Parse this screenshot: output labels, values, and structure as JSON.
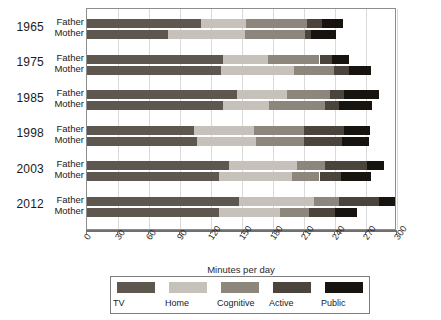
{
  "chart_data": {
    "type": "bar",
    "orientation": "horizontal",
    "stacked": true,
    "title": "",
    "xlabel": "Minutes per day",
    "ylabel": "",
    "xlim": [
      0,
      300
    ],
    "xticks": [
      0,
      30,
      60,
      90,
      120,
      150,
      180,
      210,
      240,
      270,
      300
    ],
    "grid": true,
    "legend_position": "bottom",
    "series": [
      {
        "name": "TV",
        "color": "#5e574f",
        "values": [
          110,
          78,
          132,
          130,
          145,
          132,
          104,
          106,
          137,
          128,
          147,
          128
        ]
      },
      {
        "name": "Home",
        "color": "#c6c2bb",
        "values": [
          44,
          75,
          43,
          70,
          49,
          44,
          58,
          58,
          66,
          70,
          73,
          59
        ]
      },
      {
        "name": "Cognitive",
        "color": "#8d867d",
        "values": [
          59,
          58,
          50,
          39,
          41,
          54,
          48,
          46,
          27,
          27,
          24,
          28
        ]
      },
      {
        "name": "Active",
        "color": "#4a443c",
        "values": [
          14,
          6,
          12,
          15,
          14,
          14,
          39,
          37,
          41,
          21,
          39,
          25
        ]
      },
      {
        "name": "Public",
        "color": "#17140f",
        "values": [
          21,
          24,
          17,
          21,
          34,
          32,
          25,
          26,
          16,
          29,
          15,
          21
        ]
      }
    ],
    "groups": [
      {
        "year": "1965",
        "rows": [
          "Father",
          "Mother"
        ]
      },
      {
        "year": "1975",
        "rows": [
          "Father",
          "Mother"
        ]
      },
      {
        "year": "1985",
        "rows": [
          "Father",
          "Mother"
        ]
      },
      {
        "year": "1998",
        "rows": [
          "Father",
          "Mother"
        ]
      },
      {
        "year": "2003",
        "rows": [
          "Father",
          "Mother"
        ]
      },
      {
        "year": "2012",
        "rows": [
          "Father",
          "Mother"
        ]
      }
    ],
    "bars": [
      {
        "year": "1965",
        "parent": "Father",
        "segments": [
          110,
          44,
          59,
          14,
          21
        ],
        "total": 248
      },
      {
        "year": "1965",
        "parent": "Mother",
        "segments": [
          78,
          75,
          58,
          6,
          24
        ],
        "total": 241
      },
      {
        "year": "1975",
        "parent": "Father",
        "segments": [
          132,
          43,
          50,
          12,
          17
        ],
        "total": 254
      },
      {
        "year": "1975",
        "parent": "Mother",
        "segments": [
          130,
          70,
          39,
          15,
          21
        ],
        "total": 275
      },
      {
        "year": "1985",
        "parent": "Father",
        "segments": [
          145,
          49,
          41,
          14,
          34
        ],
        "total": 283
      },
      {
        "year": "1985",
        "parent": "Mother",
        "segments": [
          132,
          44,
          54,
          14,
          32
        ],
        "total": 276
      },
      {
        "year": "1998",
        "parent": "Father",
        "segments": [
          104,
          58,
          48,
          39,
          25
        ],
        "total": 274
      },
      {
        "year": "1998",
        "parent": "Mother",
        "segments": [
          106,
          58,
          46,
          37,
          26
        ],
        "total": 273
      },
      {
        "year": "2003",
        "parent": "Father",
        "segments": [
          137,
          66,
          27,
          41,
          16
        ],
        "total": 287
      },
      {
        "year": "2003",
        "parent": "Mother",
        "segments": [
          128,
          70,
          27,
          21,
          29
        ],
        "total": 275
      },
      {
        "year": "2012",
        "parent": "Father",
        "segments": [
          147,
          73,
          24,
          39,
          15
        ],
        "total": 298
      },
      {
        "year": "2012",
        "parent": "Mother",
        "segments": [
          128,
          59,
          28,
          25,
          21
        ],
        "total": 261
      }
    ]
  },
  "axis": {
    "title": "Minutes per day",
    "tick_labels": [
      "0",
      "30",
      "60",
      "90",
      "120",
      "150",
      "180",
      "210",
      "240",
      "270",
      "300"
    ]
  },
  "legend": {
    "items": [
      {
        "label": "TV",
        "color": "#5e574f"
      },
      {
        "label": "Home",
        "color": "#c6c2bb"
      },
      {
        "label": "Cognitive",
        "color": "#8d867d"
      },
      {
        "label": "Active",
        "color": "#4a443c"
      },
      {
        "label": "Public",
        "color": "#17140f"
      }
    ]
  }
}
